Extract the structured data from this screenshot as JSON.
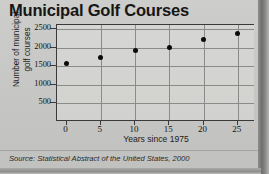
{
  "figure": {
    "title": "Municipal Golf Courses",
    "source_note": "Source: Statistical Abstract of the United States, 2000",
    "background_color": "#c6c6c4",
    "marker_color": "#0b0b0b",
    "grid_color": "#8b8b89",
    "axis_color": "#3a3a3a"
  },
  "chart_data": {
    "type": "scatter",
    "title": "Municipal Golf Courses",
    "xlabel": "Years since 1975",
    "ylabel": "Number of municipal golf courses",
    "ylabel_lines": [
      "Number of municipal",
      "golf courses"
    ],
    "x": [
      0,
      5,
      10,
      15,
      20,
      25
    ],
    "values": [
      1570,
      1740,
      1930,
      2010,
      2230,
      2380
    ],
    "xticks": [
      0,
      5,
      10,
      15,
      20,
      25
    ],
    "xtick_labels": [
      "0",
      "5",
      "10",
      "15",
      "20",
      "25"
    ],
    "yticks": [
      500,
      1000,
      1500,
      2000,
      2500
    ],
    "ytick_labels": [
      "500",
      "1000",
      "1500",
      "2000",
      "2500"
    ],
    "xlim": [
      -1.4,
      27.5
    ],
    "ylim": [
      0,
      2620
    ],
    "grid": true,
    "legend": false,
    "legend_position": "none"
  }
}
